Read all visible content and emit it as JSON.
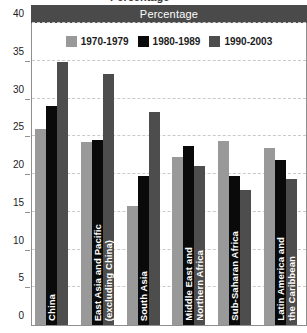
{
  "header": {
    "band_title": "Percentage",
    "clipped_top_text": "Percentage"
  },
  "legend": {
    "position": "top-center",
    "entries": [
      {
        "label": "1970-1979",
        "color": "#999999",
        "swatch_icon": "legend-swatch-icon"
      },
      {
        "label": "1980-1989",
        "color": "#0a0a0a",
        "swatch_icon": "legend-swatch-icon"
      },
      {
        "label": "1990-2003",
        "color": "#4d4d4d",
        "swatch_icon": "legend-swatch-icon"
      }
    ]
  },
  "y_axis": {
    "ticks": [
      "0",
      "5",
      "10",
      "15",
      "20",
      "25",
      "30",
      "35",
      "40"
    ]
  },
  "colors": {
    "series_1970_1979": "#999999",
    "series_1980_1989": "#0a0a0a",
    "series_1990_2003": "#4d4d4d",
    "header_band": "#4a4a4a",
    "gridline": "#c9c9c9",
    "axis": "#8f8f8f",
    "label_text": "#ffffff",
    "background": "#ffffff"
  },
  "chart_data": {
    "type": "bar",
    "title": "Percentage",
    "xlabel": "",
    "ylabel": "Percentage",
    "ylim": [
      0,
      40
    ],
    "ytick_step": 5,
    "grid": true,
    "legend_position": "top-center",
    "categories": [
      "China",
      "East Asia and Pacific (excluding China)",
      "South Asia",
      "Middle East and Northern Africa",
      "Sub-Saharan Africa",
      "Latin America and the Caribbean"
    ],
    "category_labels_multiline": [
      "China",
      "East Asia and Pacific\n(excluding China)",
      "South Asia",
      "Middle East and\nNorthern Africa",
      "Sub-Saharan Africa",
      "Latin America and\nthe Caribbean"
    ],
    "series": [
      {
        "name": "1970-1979",
        "color": "#999999",
        "values": [
          26.0,
          24.3,
          15.7,
          22.3,
          24.4,
          23.4
        ]
      },
      {
        "name": "1980-1989",
        "color": "#0a0a0a",
        "values": [
          29.0,
          24.5,
          19.8,
          23.7,
          19.8,
          21.8
        ]
      },
      {
        "name": "1990-2003",
        "color": "#4d4d4d",
        "values": [
          34.9,
          33.3,
          28.2,
          21.0,
          17.9,
          19.3
        ]
      }
    ]
  }
}
